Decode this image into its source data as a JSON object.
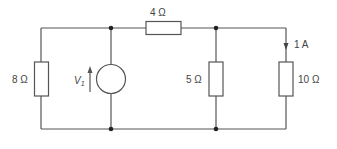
{
  "diagram": {
    "type": "circuit",
    "components": {
      "r_left": {
        "label": "8 Ω",
        "value": "8",
        "unit": "Ω"
      },
      "r_top": {
        "label": "4 Ω",
        "value": "4",
        "unit": "Ω"
      },
      "r_mid": {
        "label": "5 Ω",
        "value": "5",
        "unit": "Ω"
      },
      "r_right": {
        "label": "10 Ω",
        "value": "10",
        "unit": "Ω"
      },
      "source": {
        "label_main": "V",
        "label_sub": "1"
      },
      "current": {
        "label": "1 A"
      }
    },
    "colors": {
      "wire": "#555555",
      "text": "#444444",
      "node": "#222222"
    }
  }
}
